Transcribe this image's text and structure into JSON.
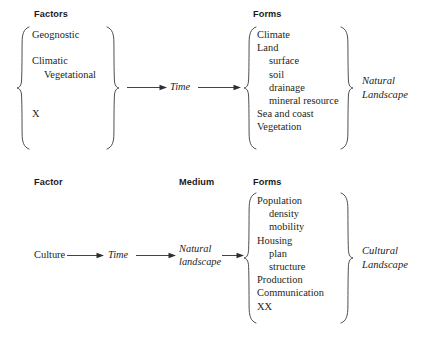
{
  "figure": {
    "type": "flow-diagram",
    "background_color": "#ffffff",
    "ink_color": "#231f20"
  },
  "diagrams": [
    {
      "id": "natural-landscape",
      "headers": {
        "factors": "Factors",
        "forms": "Forms"
      },
      "factors": [
        "Geognostic",
        "",
        "Climatic",
        "Vegetational",
        "",
        "",
        "X"
      ],
      "time_label": "Time",
      "forms": [
        "Climate",
        "Land",
        "surface",
        "soil",
        "drainage",
        "mineral resource",
        "Sea and coast",
        "Vegetation"
      ],
      "outcome": {
        "line1": "Natural",
        "line2": "Landscape"
      }
    },
    {
      "id": "cultural-landscape",
      "headers": {
        "factor": "Factor",
        "medium": "Medium",
        "forms": "Forms"
      },
      "factor_label": "Culture",
      "time_label": "Time",
      "medium": {
        "line1": "Natural",
        "line2": "landscape"
      },
      "forms": [
        "Population",
        "density",
        "mobility",
        "Housing",
        "plan",
        "structure",
        "Production",
        "Communication",
        "XX"
      ],
      "outcome": {
        "line1": "Cultural",
        "line2": "Landscape"
      }
    }
  ]
}
